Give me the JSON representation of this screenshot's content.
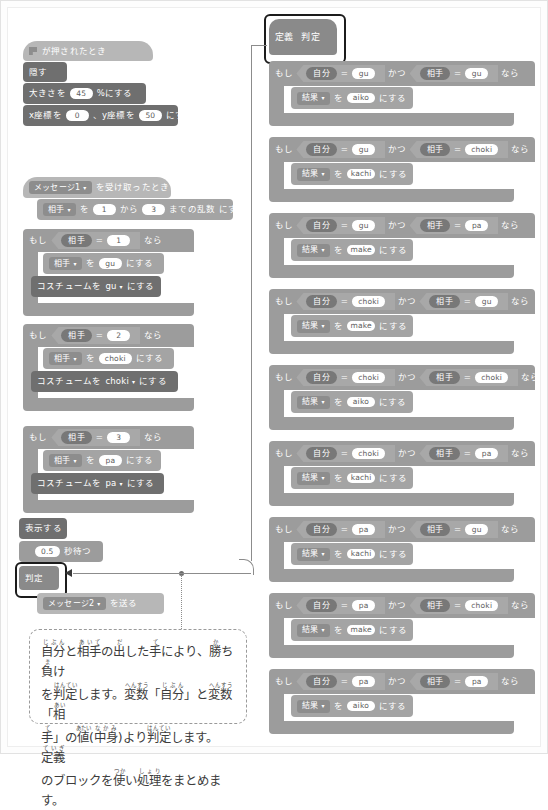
{
  "left_column": {
    "script1": {
      "hat": {
        "flag_icon": "green-flag-icon",
        "label": "が押されたとき"
      },
      "blocks": [
        {
          "label": "隠す"
        },
        {
          "pre": "大きさを",
          "value": "45",
          "post": "%にする"
        },
        {
          "pre": "x座標を",
          "value": "0",
          "mid": "、y座標を",
          "value2": "50",
          "post": "にする"
        }
      ]
    },
    "script2": {
      "hat": {
        "message": "メッセージ1",
        "caret": "▾",
        "label": "を受け取ったとき"
      },
      "setrandom": {
        "var": "相手",
        "caret": "▾",
        "wo": "を",
        "from": "1",
        "kara": "から",
        "to": "3",
        "made": "までの乱数",
        "nisuru": "にする"
      },
      "ifs": [
        {
          "moshi": "もし",
          "var": "相手",
          "op": "=",
          "value": "1",
          "nara": "なら",
          "set": {
            "var": "相手",
            "caret": "▾",
            "wo": "を",
            "value": "gu",
            "nisuru": "にする"
          },
          "costume": {
            "pre": "コスチュームを",
            "value": "gu",
            "caret": "▾",
            "post": "にする"
          }
        },
        {
          "moshi": "もし",
          "var": "相手",
          "op": "=",
          "value": "2",
          "nara": "なら",
          "set": {
            "var": "相手",
            "caret": "▾",
            "wo": "を",
            "value": "choki",
            "nisuru": "にする"
          },
          "costume": {
            "pre": "コスチュームを",
            "value": "choki",
            "caret": "▾",
            "post": "にする"
          }
        },
        {
          "moshi": "もし",
          "var": "相手",
          "op": "=",
          "value": "3",
          "nara": "なら",
          "set": {
            "var": "相手",
            "caret": "▾",
            "wo": "を",
            "value": "pa",
            "nisuru": "にする"
          },
          "costume": {
            "pre": "コスチュームを",
            "value": "pa",
            "caret": "▾",
            "post": "にする"
          }
        }
      ],
      "show": "表示する",
      "wait": {
        "value": "0.5",
        "post": "秒待つ"
      },
      "custom_call": "判定",
      "broadcast": {
        "message": "メッセージ2",
        "caret": "▾",
        "post": "を送る"
      }
    }
  },
  "right_column": {
    "define": {
      "keyword": "定義",
      "name": "判定"
    },
    "rules": [
      {
        "moshi": "もし",
        "a_var": "自分",
        "a_op": "=",
        "a_val": "gu",
        "katsu": "かつ",
        "b_var": "相手",
        "b_op": "=",
        "b_val": "gu",
        "nara": "なら",
        "result_var": "結果",
        "caret": "▾",
        "wo": "を",
        "result": "aiko",
        "nisuru": "にする"
      },
      {
        "moshi": "もし",
        "a_var": "自分",
        "a_op": "=",
        "a_val": "gu",
        "katsu": "かつ",
        "b_var": "相手",
        "b_op": "=",
        "b_val": "choki",
        "nara": "なら",
        "result_var": "結果",
        "caret": "▾",
        "wo": "を",
        "result": "kachi",
        "nisuru": "にする"
      },
      {
        "moshi": "もし",
        "a_var": "自分",
        "a_op": "=",
        "a_val": "gu",
        "katsu": "かつ",
        "b_var": "相手",
        "b_op": "=",
        "b_val": "pa",
        "nara": "なら",
        "result_var": "結果",
        "caret": "▾",
        "wo": "を",
        "result": "make",
        "nisuru": "にする"
      },
      {
        "moshi": "もし",
        "a_var": "自分",
        "a_op": "=",
        "a_val": "choki",
        "katsu": "かつ",
        "b_var": "相手",
        "b_op": "=",
        "b_val": "gu",
        "nara": "なら",
        "result_var": "結果",
        "caret": "▾",
        "wo": "を",
        "result": "make",
        "nisuru": "にする"
      },
      {
        "moshi": "もし",
        "a_var": "自分",
        "a_op": "=",
        "a_val": "choki",
        "katsu": "かつ",
        "b_var": "相手",
        "b_op": "=",
        "b_val": "choki",
        "nara": "なら",
        "result_var": "結果",
        "caret": "▾",
        "wo": "を",
        "result": "aiko",
        "nisuru": "にする"
      },
      {
        "moshi": "もし",
        "a_var": "自分",
        "a_op": "=",
        "a_val": "choki",
        "katsu": "かつ",
        "b_var": "相手",
        "b_op": "=",
        "b_val": "pa",
        "nara": "なら",
        "result_var": "結果",
        "caret": "▾",
        "wo": "を",
        "result": "kachi",
        "nisuru": "にする"
      },
      {
        "moshi": "もし",
        "a_var": "自分",
        "a_op": "=",
        "a_val": "pa",
        "katsu": "かつ",
        "b_var": "相手",
        "b_op": "=",
        "b_val": "gu",
        "nara": "なら",
        "result_var": "結果",
        "caret": "▾",
        "wo": "を",
        "result": "kachi",
        "nisuru": "にする"
      },
      {
        "moshi": "もし",
        "a_var": "自分",
        "a_op": "=",
        "a_val": "pa",
        "katsu": "かつ",
        "b_var": "相手",
        "b_op": "=",
        "b_val": "choki",
        "nara": "なら",
        "result_var": "結果",
        "caret": "▾",
        "wo": "を",
        "result": "make",
        "nisuru": "にする"
      },
      {
        "moshi": "もし",
        "a_var": "自分",
        "a_op": "=",
        "a_val": "pa",
        "katsu": "かつ",
        "b_var": "相手",
        "b_op": "=",
        "b_val": "pa",
        "nara": "なら",
        "result_var": "結果",
        "caret": "▾",
        "wo": "を",
        "result": "aiko",
        "nisuru": "にする"
      }
    ]
  },
  "annotation": {
    "line1": "自分と相手の出した手により、勝ち負け",
    "line2": "を判定します。変数「自分」と変数「相",
    "line3": "手」の値(中身)より判定します。定義",
    "line4": "のブロックを使い処理をまとめます。"
  },
  "colors": {
    "events": "#b7b7b7",
    "control": "#9c9c9c",
    "looks": "#6f6f6f",
    "variables": "#a4a4a4",
    "highlight_border": "#1c1c1c",
    "note_border": "#9a9a9a",
    "page_bg": "#ffffff"
  }
}
